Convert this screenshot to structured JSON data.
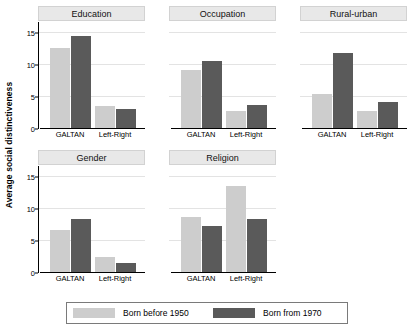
{
  "chart_data": {
    "type": "bar",
    "title": "",
    "xlabel": "",
    "ylabel": "Average social distinctiveness",
    "ylim": [
      0,
      16.5
    ],
    "yticks": [
      0,
      5,
      10,
      15
    ],
    "ytick_labels": [
      "0",
      "5",
      "10",
      "15"
    ],
    "grid": true,
    "grid_axis": "y",
    "categories": [
      "GALTAN",
      "Left-Right"
    ],
    "legend_position": "bottom",
    "series": [
      {
        "name": "Born before 1950",
        "color": "#cdcdcd"
      },
      {
        "name": "Born from 1970",
        "color": "#5a5a5a"
      }
    ],
    "panel_layout": {
      "rows": 2,
      "cols": 3
    },
    "panels": [
      {
        "title": "Education",
        "row": 0,
        "col": 0,
        "values": {
          "Born before 1950": [
            12.4,
            3.5
          ],
          "Born from 1970": [
            14.4,
            3.0
          ]
        }
      },
      {
        "title": "Occupation",
        "row": 0,
        "col": 1,
        "values": {
          "Born before 1950": [
            9.1,
            2.6
          ],
          "Born from 1970": [
            10.4,
            3.6
          ]
        }
      },
      {
        "title": "Rural-urban",
        "row": 0,
        "col": 2,
        "values": {
          "Born before 1950": [
            5.3,
            2.7
          ],
          "Born from 1970": [
            11.7,
            4.0
          ]
        }
      },
      {
        "title": "Gender",
        "row": 1,
        "col": 0,
        "values": {
          "Born before 1950": [
            6.5,
            2.4
          ],
          "Born from 1970": [
            8.2,
            1.4
          ]
        }
      },
      {
        "title": "Religion",
        "row": 1,
        "col": 1,
        "values": {
          "Born before 1950": [
            8.6,
            13.4
          ],
          "Born from 1970": [
            7.2,
            8.2
          ]
        }
      }
    ]
  },
  "legend": {
    "items": [
      {
        "label": "Born before 1950",
        "swatch": "before"
      },
      {
        "label": "Born from 1970",
        "swatch": "from"
      }
    ]
  }
}
